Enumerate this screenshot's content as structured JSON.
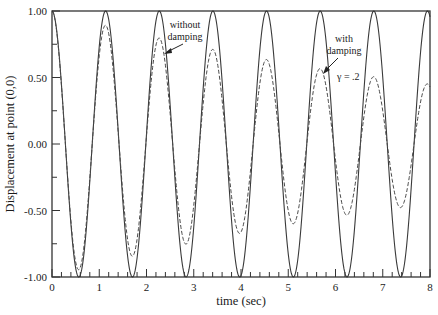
{
  "chart_data": {
    "type": "line",
    "title": "",
    "xlabel": "time (sec)",
    "ylabel": "Displacement at point (0,0)",
    "xlim": [
      0,
      8
    ],
    "ylim": [
      -1.0,
      1.0
    ],
    "x_ticks": [
      "0",
      "1",
      "2",
      "3",
      "4",
      "5",
      "6",
      "7",
      "8"
    ],
    "y_ticks": [
      "1.00",
      "0.50",
      "0.00",
      "-0.50",
      "-1.00"
    ],
    "grid": false,
    "legend": null,
    "series": [
      {
        "name": "without damping",
        "style": "solid",
        "model": "cos(omega*t)",
        "omega": 5.535,
        "peaks_t": [
          0,
          1.135,
          2.27,
          3.405,
          4.54,
          5.675,
          6.81,
          7.945
        ],
        "peak_values": [
          1.0,
          1.0,
          1.0,
          1.0,
          1.0,
          1.0,
          1.0,
          1.0
        ],
        "trough_values": [
          -1.0,
          -1.0,
          -1.0,
          -1.0,
          -1.0,
          -1.0,
          -1.0
        ]
      },
      {
        "name": "with damping",
        "style": "dashed",
        "gamma": 0.2,
        "model": "exp(-0.1*t)*cos(omega*t)",
        "omega": 5.535,
        "peak_values": [
          1.0,
          0.88,
          0.75,
          0.7,
          0.62,
          0.55,
          0.5,
          0.44
        ],
        "trough_values": [
          -0.93,
          -0.82,
          -0.75,
          -0.67,
          -0.6,
          -0.54,
          -0.49
        ]
      }
    ],
    "annotations": [
      {
        "text_lines": [
          "without",
          "damping"
        ],
        "arrow_to": [
          2.35,
          0.68
        ]
      },
      {
        "text_lines": [
          "with",
          "damping"
        ],
        "arrow_to": [
          5.65,
          0.55
        ]
      },
      {
        "text": "γ = .2",
        "at": [
          6.1,
          0.52
        ]
      }
    ]
  }
}
